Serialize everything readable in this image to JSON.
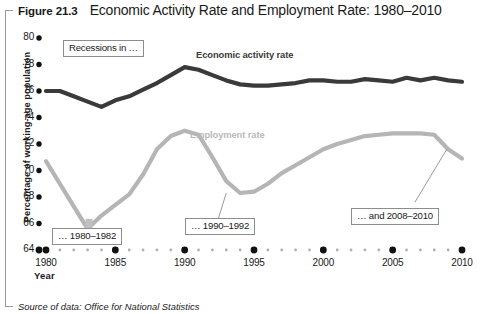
{
  "figure": {
    "number": "Figure 21.3",
    "title": "Economic Activity Rate and Employment Rate: 1980–2010",
    "source": "Source of data: Office for National Statistics"
  },
  "annotations": [
    {
      "id": "recessions",
      "text": "Recessions in …"
    },
    {
      "id": "r8082",
      "text": "… 1980–1982"
    },
    {
      "id": "r9092",
      "text": "… 1990–1992"
    },
    {
      "id": "r0810",
      "text": "… and 2008–2010"
    }
  ],
  "chart_data": {
    "type": "line",
    "title": "Economic Activity Rate and Employment Rate: 1980–2010",
    "xlabel": "Year",
    "ylabel": "Percentage of working-age population",
    "xlim": [
      1980,
      2010
    ],
    "ylim": [
      64,
      80
    ],
    "ytick_labels": [
      "64",
      "66",
      "68",
      "70",
      "72",
      "74",
      "76",
      "78",
      "80"
    ],
    "yticks": [
      64,
      66,
      68,
      70,
      72,
      74,
      76,
      78,
      80
    ],
    "xtick_labels": [
      "1980",
      "1985",
      "1990",
      "1995",
      "2000",
      "2005",
      "2010"
    ],
    "xticks": [
      1980,
      1985,
      1990,
      1995,
      2000,
      2005,
      2010
    ],
    "grid": false,
    "legend": "inline-series-labels",
    "x": [
      1980,
      1981,
      1982,
      1983,
      1984,
      1985,
      1986,
      1987,
      1988,
      1989,
      1990,
      1991,
      1992,
      1993,
      1994,
      1995,
      1996,
      1997,
      1998,
      1999,
      2000,
      2001,
      2002,
      2003,
      2004,
      2005,
      2006,
      2007,
      2008,
      2009,
      2010
    ],
    "series": [
      {
        "name": "Economic activity rate",
        "color": "#3a3a3a",
        "values": [
          76.0,
          76.0,
          75.6,
          75.2,
          74.8,
          75.3,
          75.6,
          76.1,
          76.6,
          77.2,
          77.8,
          77.6,
          77.2,
          76.8,
          76.5,
          76.4,
          76.4,
          76.5,
          76.6,
          76.8,
          76.8,
          76.7,
          76.7,
          76.9,
          76.8,
          76.7,
          77.0,
          76.8,
          77.0,
          76.8,
          76.7
        ]
      },
      {
        "name": "Employment rate",
        "color": "#b5b5b5",
        "values": [
          70.7,
          69.0,
          67.3,
          65.6,
          66.6,
          67.4,
          68.2,
          69.7,
          71.6,
          72.6,
          73.0,
          72.7,
          71.0,
          69.2,
          68.3,
          68.4,
          69.0,
          69.8,
          70.4,
          71.0,
          71.6,
          72.0,
          72.3,
          72.6,
          72.7,
          72.8,
          72.8,
          72.8,
          72.7,
          71.6,
          70.9
        ]
      }
    ]
  }
}
